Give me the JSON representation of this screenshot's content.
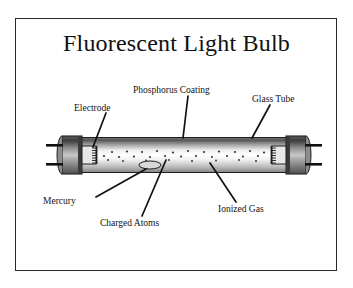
{
  "figure": {
    "title": "Fluorescent Light Bulb",
    "border_color": "#2a2a2a",
    "background_color": "#ffffff",
    "text_color": "#111111"
  },
  "labels": {
    "electrode": "Electrode",
    "phosphorus": "Phosphorus Coating",
    "glass_tube": "Glass Tube",
    "mercury": "Mercury",
    "charged_atoms": "Charged Atoms",
    "ionized_gas": "Ionized Gas"
  },
  "diagram": {
    "tube_body_color": "#f5f5f5",
    "tube_shade_color": "#6e6e6e",
    "end_cap_color": "#4a4a4a",
    "pin_color": "#1a1a1a",
    "atom_dot_color": "#333333",
    "leader_line_color": "#111111",
    "parts": [
      "glass-tube",
      "left-end-cap",
      "right-end-cap",
      "left-electrode",
      "right-electrode",
      "mercury-droplet",
      "charged-atom-dots",
      "phosphorus-coating",
      "ionized-gas"
    ]
  }
}
